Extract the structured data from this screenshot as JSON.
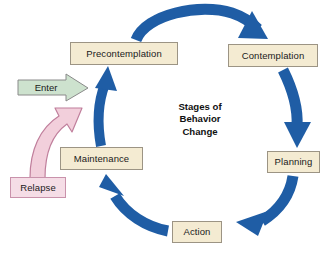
{
  "figure": {
    "title_lines": [
      "Stages of",
      "Behavior",
      "Change"
    ],
    "background_color": "#ffffff"
  },
  "palette": {
    "stage_box_fill": "#f4ebd2",
    "stage_box_border": "#9c9484",
    "cycle_arrow_blue": "#1f5da5",
    "enter_arrow_green": "#cde2ce",
    "enter_arrow_border": "#808080",
    "relapse_box_fill": "#f5dde6",
    "relapse_box_border": "#c992ab",
    "relapse_arrow_fill": "#f2cfdb",
    "relapse_arrow_border": "#c07f9c",
    "text_color": "#1a1a1a"
  },
  "stages": [
    {
      "id": "precontemplation",
      "label": "Precontemplation",
      "x": 70,
      "y": 42,
      "w": 108,
      "h": 23
    },
    {
      "id": "contemplation",
      "label": "Contemplation",
      "x": 228,
      "y": 44,
      "w": 90,
      "h": 23
    },
    {
      "id": "planning",
      "label": "Planning",
      "x": 267,
      "y": 151,
      "w": 53,
      "h": 22
    },
    {
      "id": "action",
      "label": "Action",
      "x": 172,
      "y": 221,
      "w": 50,
      "h": 22
    },
    {
      "id": "maintenance",
      "label": "Maintenance",
      "x": 60,
      "y": 147,
      "w": 83,
      "h": 23
    }
  ],
  "entry": {
    "enter_label": "Enter",
    "relapse_label": "Relapse",
    "relapse_box": {
      "x": 10,
      "y": 177,
      "w": 56,
      "h": 21
    }
  },
  "cycle_arrows": [
    {
      "id": "precontemplation-to-contemplation",
      "from": "Precontemplation",
      "to": "Contemplation"
    },
    {
      "id": "contemplation-to-planning",
      "from": "Contemplation",
      "to": "Planning"
    },
    {
      "id": "planning-to-action",
      "from": "Planning",
      "to": "Action"
    },
    {
      "id": "action-to-maintenance",
      "from": "Action",
      "to": "Maintenance"
    },
    {
      "id": "maintenance-to-precontemplation",
      "from": "Maintenance",
      "to": "Precontemplation"
    }
  ],
  "entry_arrows": [
    {
      "id": "enter-arrow",
      "label": "Enter",
      "target": "cycle"
    },
    {
      "id": "relapse-arrow",
      "label": "Relapse",
      "target": "Maintenance"
    }
  ]
}
